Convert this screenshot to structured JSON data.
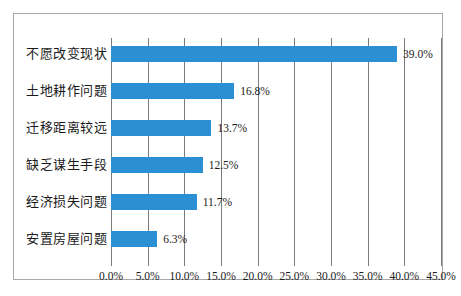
{
  "chart_data": {
    "type": "bar",
    "orientation": "horizontal",
    "title": "",
    "xlabel": "",
    "ylabel": "",
    "categories": [
      "不愿改变现状",
      "土地耕作问题",
      "迁移距离较远",
      "缺乏谋生手段",
      "经济损失问题",
      "安置房屋问题"
    ],
    "values": [
      39.0,
      16.8,
      13.7,
      12.5,
      11.7,
      6.3
    ],
    "value_labels": [
      "39.0%",
      "16.8%",
      "13.7%",
      "12.5%",
      "11.7%",
      "6.3%"
    ],
    "xlim": [
      0,
      45
    ],
    "xticks": [
      0,
      5,
      10,
      15,
      20,
      25,
      30,
      35,
      40,
      45
    ],
    "xtick_labels": [
      "0.0%",
      "5.0%",
      "10.0%",
      "15.0%",
      "20.0%",
      "25.0%",
      "30.0%",
      "35.0%",
      "40.0%",
      "45.0%"
    ],
    "grid": true,
    "grid_axis": "x",
    "legend": false,
    "bar_color": "#2b8fd4",
    "grid_color": "#7b7b7b",
    "border_color": "#a8a8a8",
    "background_color": "#ffffff",
    "text_color": "#1a1a1a"
  }
}
